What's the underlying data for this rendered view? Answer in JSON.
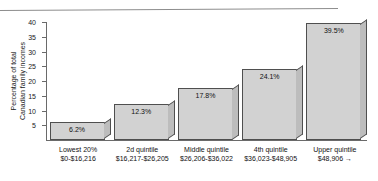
{
  "chart_data": {
    "type": "bar",
    "title": "",
    "xlabel": "",
    "ylabel": "Percentage of total Canadian family incomes",
    "ylabel_lines": [
      "Percentage of total",
      "Canadian family incomes"
    ],
    "ylim": [
      0,
      40
    ],
    "ytick_labels": [
      "40",
      "35",
      "30",
      "25",
      "20",
      "15",
      "10",
      "5"
    ],
    "ytick_values": [
      40,
      35,
      30,
      25,
      20,
      15,
      10,
      5
    ],
    "grid": false,
    "legend": null,
    "categories": [
      "Lowest 20%",
      "2d quintile",
      "Middle quintile",
      "4th quintile",
      "Upper quintile"
    ],
    "category_sublabels": [
      "$0-$16,216",
      "$16,217-$26,205",
      "$26,206-$36,022",
      "$36,023-$48,905",
      "$48,906 →"
    ],
    "values": [
      6.2,
      12.3,
      17.8,
      24.1,
      39.5
    ],
    "value_labels": [
      "6.2%",
      "12.3%",
      "17.8%",
      "24.1%",
      "39.5%"
    ],
    "colors": {
      "bar_face": "#d2d2d2",
      "bar_side": "#bdbdbd",
      "bar_edge": "#4f4f4f",
      "axis": "#6a6a6a",
      "text": "#111111",
      "background": "#ffffff"
    }
  }
}
